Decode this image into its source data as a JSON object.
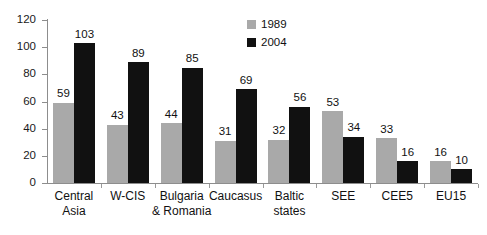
{
  "chart_data": {
    "type": "bar",
    "title": "",
    "xlabel": "",
    "ylabel": "",
    "ylim": [
      0,
      120
    ],
    "yticks": [
      0,
      20,
      40,
      60,
      80,
      100,
      120
    ],
    "grid": false,
    "legend_position": "top-right",
    "categories": [
      "Central\nAsia",
      "W-CIS",
      "Bulgaria\n& Romania",
      "Caucasus",
      "Baltic\nstates",
      "SEE",
      "CEE5",
      "EU15"
    ],
    "series": [
      {
        "name": "1989",
        "color": "#a9a9a9",
        "values": [
          59,
          43,
          44,
          31,
          32,
          53,
          33,
          16
        ]
      },
      {
        "name": "2004",
        "color": "#111111",
        "values": [
          103,
          89,
          85,
          69,
          56,
          34,
          16,
          10
        ]
      }
    ]
  },
  "legend": {
    "items": [
      {
        "label": "1989"
      },
      {
        "label": "2004"
      }
    ]
  },
  "axis": {
    "y_tick_labels": [
      "120",
      "100",
      "80",
      "60",
      "40",
      "20",
      "0"
    ]
  }
}
